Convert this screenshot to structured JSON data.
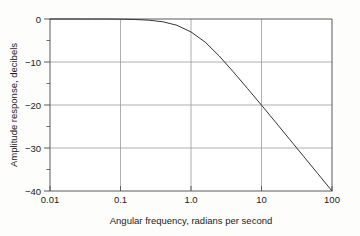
{
  "chart_data": {
    "type": "line",
    "title": "",
    "subtitle": "",
    "xlabel": "Angular frequency, radians per second",
    "ylabel": "Amplitude response, decibels",
    "xscale": "log",
    "yscale": "linear",
    "xlim": [
      0.01,
      100
    ],
    "ylim": [
      -40,
      0
    ],
    "grid": true,
    "legend": false,
    "legend_position": "none",
    "xticks": [
      0.01,
      0.1,
      1.0,
      10,
      100
    ],
    "xticklabels": [
      "0.01",
      "0.1",
      "1.0",
      "10",
      "100"
    ],
    "yticks": [
      0,
      -10,
      -20,
      -30,
      -40
    ],
    "yticklabels": [
      "0",
      "−10",
      "−20",
      "−30",
      "−40"
    ],
    "y_minor_ticks": [
      -5,
      -15,
      -25,
      -35
    ],
    "series": [
      {
        "name": "amplitude response",
        "color": "#333333",
        "linewidth": 1.0,
        "x": [
          0.01,
          0.0158,
          0.0251,
          0.0398,
          0.0631,
          0.1,
          0.1585,
          0.2512,
          0.3981,
          0.631,
          1.0,
          1.585,
          2.512,
          3.981,
          6.31,
          10.0,
          15.85,
          25.12,
          39.81,
          63.1,
          100.0
        ],
        "y": [
          0.0,
          0.0,
          0.0,
          -0.01,
          -0.01,
          -0.04,
          -0.11,
          -0.27,
          -0.64,
          -1.46,
          -3.01,
          -5.36,
          -8.59,
          -12.3,
          -16.13,
          -20.04,
          -24.0,
          -28.0,
          -32.0,
          -36.0,
          -40.0
        ]
      }
    ],
    "annotations": []
  },
  "axis": {
    "x_title": "Angular frequency, radians per second",
    "y_title": "Amplitude response, decibels",
    "x_tick_labels": [
      "0.01",
      "0.1",
      "1.0",
      "10",
      "100"
    ],
    "y_tick_labels": [
      "0",
      "−10",
      "−20",
      "−30",
      "−40"
    ]
  },
  "colors": {
    "background": "#fdfdfc",
    "plot_background": "#ffffff",
    "frame": "#5a5a5a",
    "gridline": "#9a9a9a",
    "curve": "#333333",
    "text": "#1b1b1b"
  }
}
